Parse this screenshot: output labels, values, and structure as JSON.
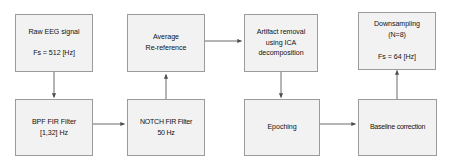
{
  "diagram": {
    "type": "flowchart",
    "background_color": "#ffffff",
    "node_fill_color": "#f2f2f2",
    "node_border_color": "#9b9b9b",
    "connector_color": "#595959",
    "text_color": "#131313",
    "nodes": [
      {
        "id": "raw-eeg-signal",
        "label": "Raw EEG signal\n\nFs = 512 [Hz]",
        "row": "top",
        "column": 1
      },
      {
        "id": "bpf-fir-filter",
        "label": "BPF FIR Filter\n[1,32] Hz",
        "row": "bottom",
        "column": 1
      },
      {
        "id": "average-re-reference",
        "label": "Average\nRe-reference",
        "row": "top",
        "column": 2
      },
      {
        "id": "notch-fir-filter",
        "label": "NOTCH FIR Filter\n50 Hz",
        "row": "bottom",
        "column": 2
      },
      {
        "id": "artifact-removal-ica",
        "label": "Artifact removal\nusing ICA\ndecomposition",
        "row": "top",
        "column": 3
      },
      {
        "id": "epoching",
        "label": "Epoching",
        "row": "bottom",
        "column": 3
      },
      {
        "id": "downsampling",
        "label": "Downsampling\n(N=8)\n\nFs = 64 [Hz]",
        "row": "top",
        "column": 4
      },
      {
        "id": "baseline-correction",
        "label": "Baseline correction",
        "row": "bottom",
        "column": 4
      }
    ],
    "connectors": [
      {
        "id": "raw-eeg-to-bpf",
        "from": "raw-eeg-signal",
        "to": "bpf-fir-filter",
        "direction": "down"
      },
      {
        "id": "bpf-to-notch",
        "from": "bpf-fir-filter",
        "to": "notch-fir-filter",
        "direction": "right"
      },
      {
        "id": "notch-to-average",
        "from": "notch-fir-filter",
        "to": "average-re-reference",
        "direction": "up"
      },
      {
        "id": "average-to-artifact",
        "from": "average-re-reference",
        "to": "artifact-removal-ica",
        "direction": "right"
      },
      {
        "id": "artifact-to-epoching",
        "from": "artifact-removal-ica",
        "to": "epoching",
        "direction": "down"
      },
      {
        "id": "epoching-to-baseline",
        "from": "epoching",
        "to": "baseline-correction",
        "direction": "right"
      },
      {
        "id": "baseline-to-downsampling",
        "from": "baseline-correction",
        "to": "downsampling",
        "direction": "up"
      }
    ]
  }
}
